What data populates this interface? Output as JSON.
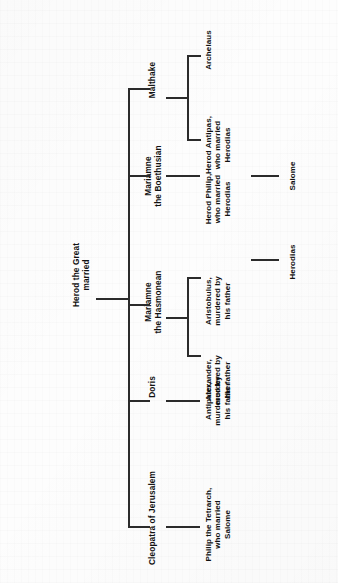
{
  "diagram": {
    "orientation": "rotated-90-ccw",
    "ink_color": "#2b2b2b",
    "paper_color": "#fdfdfd",
    "root": {
      "label": "Herod the Great\nmarried"
    },
    "wives": [
      {
        "label": "Cleopatra of Jerusalem"
      },
      {
        "label": "Doris"
      },
      {
        "label": "Mariamne\nthe Hasmonean"
      },
      {
        "label": "Mariamne\nthe Boethusian"
      },
      {
        "label": "Malthake"
      }
    ],
    "children": [
      {
        "label": "Philip the Tetrarch,\nwho married\nSalome"
      },
      {
        "label": "Antipater,\nmurdered by\nhis father"
      },
      {
        "label": "Alexander,\nmurdered by\nhis father"
      },
      {
        "label": "Aristobulus,\nmurdered by\nhis father"
      },
      {
        "label": "Herod Philip,\nwho married\nHerodias"
      },
      {
        "label": "Herod Antipas,\nwho married\nHerodias"
      },
      {
        "label": "Archelaus"
      }
    ],
    "grandchildren": [
      {
        "label": "Herodias"
      },
      {
        "label": "Salome"
      }
    ]
  }
}
